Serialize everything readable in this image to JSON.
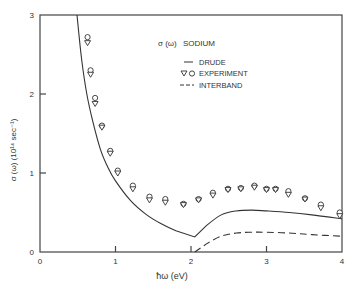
{
  "chart_data": {
    "type": "line",
    "xlabel": "ħω (eV)",
    "ylabel": "σ(ω) (10¹⁴ sec⁻¹)",
    "xlim": [
      0,
      4
    ],
    "ylim": [
      0,
      3
    ],
    "xticks": [
      0,
      1,
      2,
      3,
      4
    ],
    "yticks": [
      0,
      1,
      2,
      3
    ],
    "grid": false,
    "legend_position": "upper-right-inside",
    "legend": [
      {
        "label": "DRUDE",
        "style": "solid"
      },
      {
        "label": "EXPERIMENT",
        "style": "markers-triangle-circle"
      },
      {
        "label": "INTERBAND",
        "style": "dashed"
      }
    ],
    "series": [
      {
        "name": "DRUDE",
        "style": "solid",
        "x": [
          0.49,
          0.55,
          0.62,
          0.7,
          0.8,
          0.9,
          1.0,
          1.2,
          1.4,
          1.6,
          1.8,
          2.05,
          2.2,
          2.4,
          2.6,
          2.8,
          3.0,
          3.3,
          3.6,
          4.0
        ],
        "y": [
          3.0,
          2.45,
          2.0,
          1.65,
          1.3,
          1.07,
          0.9,
          0.65,
          0.48,
          0.36,
          0.27,
          0.19,
          0.33,
          0.47,
          0.52,
          0.53,
          0.52,
          0.5,
          0.47,
          0.42
        ]
      },
      {
        "name": "INTERBAND",
        "style": "dashed",
        "x": [
          2.05,
          2.2,
          2.4,
          2.6,
          2.8,
          3.0,
          3.3,
          3.6,
          4.0
        ],
        "y": [
          0.0,
          0.1,
          0.2,
          0.24,
          0.25,
          0.25,
          0.24,
          0.22,
          0.2
        ]
      },
      {
        "name": "EXPERIMENT (circles)",
        "style": "marker-circle",
        "x": [
          0.63,
          0.67,
          0.73,
          0.82,
          0.93,
          1.03,
          1.23,
          1.45,
          1.66,
          1.9,
          2.1,
          2.29,
          2.49,
          2.66,
          2.84,
          3.0,
          3.12,
          3.29,
          3.51,
          3.72,
          3.97
        ],
        "y": [
          2.72,
          2.3,
          1.95,
          1.6,
          1.28,
          1.03,
          0.84,
          0.7,
          0.67,
          0.61,
          0.67,
          0.75,
          0.8,
          0.81,
          0.84,
          0.8,
          0.8,
          0.77,
          0.68,
          0.6,
          0.5
        ]
      },
      {
        "name": "EXPERIMENT (triangles)",
        "style": "marker-triangle-down",
        "x": [
          0.63,
          0.67,
          0.73,
          0.82,
          0.93,
          1.03,
          1.23,
          1.45,
          1.66,
          1.9,
          2.1,
          2.29,
          2.49,
          2.66,
          2.84,
          3.0,
          3.12,
          3.29,
          3.51,
          3.72,
          3.97
        ],
        "y": [
          2.65,
          2.25,
          1.88,
          1.58,
          1.25,
          1.0,
          0.8,
          0.66,
          0.63,
          0.6,
          0.66,
          0.72,
          0.79,
          0.8,
          0.82,
          0.79,
          0.79,
          0.73,
          0.67,
          0.56,
          0.46
        ]
      }
    ]
  },
  "labels": {
    "title_sigma": "σ (ω)",
    "title_material": "SODIUM",
    "legend_drude": "DRUDE",
    "legend_experiment": "EXPERIMENT",
    "legend_interband": "INTERBAND",
    "xlabel": "ħω  (eV)",
    "ylabel": "σ (ω)  (10¹⁴ sec⁻¹)"
  }
}
